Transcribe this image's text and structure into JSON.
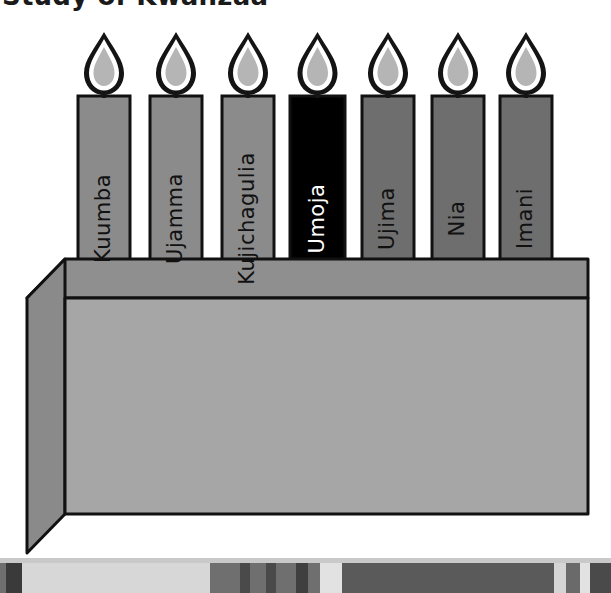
{
  "page": {
    "title": "Study of Kwanzaa",
    "background_color": "#ffffff"
  },
  "illustration": {
    "name": "kwanzaa-kinara-candles",
    "description": "Seven Kwanzaa candles in a kinara holder, each labeled with one of the seven principles",
    "candle_count": 7,
    "base": {
      "name": "kinara-base",
      "front_color": "#a6a6a6",
      "top_color": "#8f8f8f",
      "side_color": "#8a8a8a",
      "outline_color": "#111111"
    },
    "flame": {
      "outline_color": "#141414",
      "inner_color": "#ffffff",
      "core_color": "#b5b5b5"
    },
    "candles": [
      {
        "label": "Kuumba",
        "body_color": "#8b8b8b",
        "text_color": "#111111",
        "x": 78,
        "width": 52
      },
      {
        "label": "Ujamma",
        "body_color": "#8b8b8b",
        "text_color": "#111111",
        "x": 150,
        "width": 52
      },
      {
        "label": "Kujichagulia",
        "body_color": "#8b8b8b",
        "text_color": "#111111",
        "x": 222,
        "width": 52
      },
      {
        "label": "Umoja",
        "body_color": "#000000",
        "text_color": "#ffffff",
        "x": 290,
        "width": 55
      },
      {
        "label": "Ujima",
        "body_color": "#6e6e6e",
        "text_color": "#111111",
        "x": 362,
        "width": 52
      },
      {
        "label": "Nia",
        "body_color": "#6e6e6e",
        "text_color": "#111111",
        "x": 432,
        "width": 52
      },
      {
        "label": "Imani",
        "body_color": "#6e6e6e",
        "text_color": "#111111",
        "x": 500,
        "width": 52
      }
    ]
  },
  "bottom_strip": {
    "name": "bottom-toolbar-strip",
    "track_color": "#6f6f6f",
    "segments": [
      {
        "x": 0,
        "width": 6,
        "color": "#6f6f6f"
      },
      {
        "x": 6,
        "width": 16,
        "color": "#3a3a3a"
      },
      {
        "x": 22,
        "width": 188,
        "color": "#d7d7d7"
      },
      {
        "x": 210,
        "width": 30,
        "color": "#6f6f6f"
      },
      {
        "x": 240,
        "width": 10,
        "color": "#4a4a4a"
      },
      {
        "x": 250,
        "width": 16,
        "color": "#6f6f6f"
      },
      {
        "x": 266,
        "width": 10,
        "color": "#4a4a4a"
      },
      {
        "x": 276,
        "width": 20,
        "color": "#6f6f6f"
      },
      {
        "x": 296,
        "width": 12,
        "color": "#3f3f3f"
      },
      {
        "x": 308,
        "width": 12,
        "color": "#6f6f6f"
      },
      {
        "x": 320,
        "width": 22,
        "color": "#e2e2e2"
      },
      {
        "x": 342,
        "width": 212,
        "color": "#5a5a5a"
      },
      {
        "x": 554,
        "width": 12,
        "color": "#d5d5d5"
      },
      {
        "x": 566,
        "width": 14,
        "color": "#6a6a6a"
      },
      {
        "x": 580,
        "width": 10,
        "color": "#e2e2e2"
      },
      {
        "x": 590,
        "width": 21,
        "color": "#4a4a4a"
      }
    ]
  }
}
